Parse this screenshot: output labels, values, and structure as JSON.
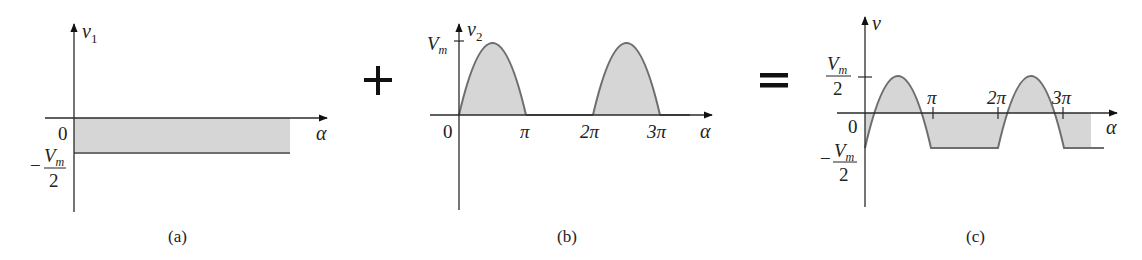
{
  "colors": {
    "axis": "#2a2a2a",
    "curve": "#6e6e6e",
    "fill": "#d6d6d6",
    "text": "#222222"
  },
  "operators": {
    "plus": "+",
    "equals": "="
  },
  "panels": [
    {
      "id": "a",
      "caption": "(a)",
      "y_label": "v",
      "y_label_sub": "1",
      "x_label": "α",
      "origin_label": "0",
      "level_label": {
        "sign": "−",
        "num": "V",
        "num_sub": "m",
        "den": "2"
      },
      "description": "Constant DC level at -Vm/2"
    },
    {
      "id": "b",
      "caption": "(b)",
      "y_label": "v",
      "y_label_sub": "2",
      "x_label": "α",
      "origin_label": "0",
      "peak_label": {
        "main": "V",
        "sub": "m"
      },
      "x_ticks": [
        "π",
        "2π",
        "3π"
      ],
      "description": "Half-wave rectified sine, peak Vm"
    },
    {
      "id": "c",
      "caption": "(c)",
      "y_label": "v",
      "x_label": "α",
      "origin_label": "0",
      "pos_label": {
        "num": "V",
        "num_sub": "m",
        "den": "2"
      },
      "neg_label": {
        "sign": "−",
        "num": "V",
        "num_sub": "m",
        "den": "2"
      },
      "x_ticks": [
        "π",
        "2π",
        "3π"
      ],
      "description": "Sum: half-wave sine shifted down by Vm/2"
    }
  ]
}
